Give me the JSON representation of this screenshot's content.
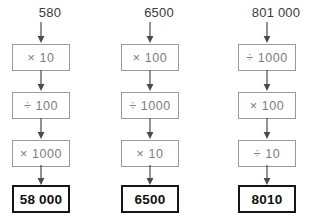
{
  "diagram": {
    "type": "function-machine-chains",
    "arrow_color": "#4a4a4a",
    "box_border_color": "#9a9a9a",
    "result_border_color": "#161616",
    "op_text_color": "#7d7d7d",
    "label_color": "#3a3a3a",
    "chains": [
      {
        "start": "580",
        "operations": [
          {
            "symbol": "×",
            "value": "10",
            "text": "× 10"
          },
          {
            "symbol": "÷",
            "value": "100",
            "text": "÷ 100"
          },
          {
            "symbol": "×",
            "value": "1000",
            "text": "× 1000"
          }
        ],
        "result": "58 000"
      },
      {
        "start": "6500",
        "operations": [
          {
            "symbol": "×",
            "value": "100",
            "text": "× 100"
          },
          {
            "symbol": "÷",
            "value": "1000",
            "text": "÷ 1000"
          },
          {
            "symbol": "×",
            "value": "10",
            "text": "× 10"
          }
        ],
        "result": "6500"
      },
      {
        "start": "801 000",
        "operations": [
          {
            "symbol": "÷",
            "value": "1000",
            "text": "÷ 1000"
          },
          {
            "symbol": "×",
            "value": "100",
            "text": "× 100"
          },
          {
            "symbol": "÷",
            "value": "10",
            "text": "÷ 10"
          }
        ],
        "result": "8010"
      }
    ]
  }
}
